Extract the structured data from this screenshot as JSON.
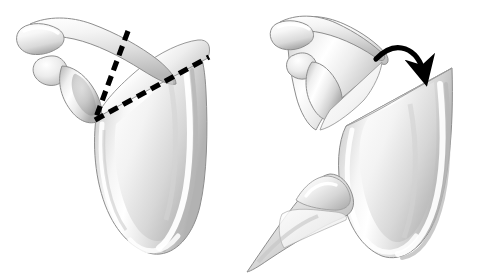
{
  "figure": {
    "title": "Scapular osteotomy: wedge resection of the scapular body",
    "background_color": "#ffffff",
    "width": 482,
    "height": 279,
    "illustration_style": "grayscale airbrush medical illustration",
    "panel_count": 2
  },
  "palette": {
    "background": "#ffffff",
    "bone_light": "#fdfdfd",
    "bone_mid": "#e3e3e3",
    "bone_shadow": "#b9b9b9",
    "bone_deep_shadow": "#9a9a9a",
    "outline": "#8d8d8d",
    "cut_face": "#efefef",
    "marking_black": "#000000"
  },
  "panels": [
    {
      "id": "panel-left",
      "name": "preoperative-planning-panel",
      "caption": "",
      "description": "Posterior view of the scapula with dashed osteotomy lines marking the planned wedge",
      "structures": [
        {
          "name": "acromion",
          "label": "Acromion"
        },
        {
          "name": "coracoid-process",
          "label": "Coracoid process"
        },
        {
          "name": "spine-of-scapula",
          "label": "Spine of scapula"
        },
        {
          "name": "glenoid",
          "label": "Glenoid"
        },
        {
          "name": "scapular-body",
          "label": "Scapular body"
        },
        {
          "name": "infraspinous-fossa",
          "label": "Infraspinous fossa"
        },
        {
          "name": "lateral-border",
          "label": "Lateral border"
        },
        {
          "name": "inferior-angle",
          "label": "Inferior angle"
        }
      ],
      "markings": [
        {
          "name": "osteotomy-line-medial",
          "style": "dashed",
          "color": "#000000",
          "thickness": 5,
          "dash": [
            10,
            6
          ],
          "from": [
            128,
            31
          ],
          "to": [
            95,
            120
          ]
        },
        {
          "name": "osteotomy-line-lateral",
          "style": "dashed",
          "color": "#000000",
          "thickness": 5,
          "dash": [
            10,
            6
          ],
          "from": [
            95,
            120
          ],
          "to": [
            209,
            57
          ]
        }
      ]
    },
    {
      "id": "panel-right",
      "name": "postoperative-result-panel",
      "caption": "",
      "description": "Scapula after the wedge has been removed; the body is rotated and the excised wedge fragment lies separately",
      "structures": [
        {
          "name": "acromion",
          "label": "Acromion"
        },
        {
          "name": "coracoid-process",
          "label": "Coracoid process"
        },
        {
          "name": "glenoid",
          "label": "Glenoid"
        },
        {
          "name": "rotated-scapular-body",
          "label": "Rotated scapular body"
        },
        {
          "name": "osteotomy-cut-surface",
          "label": "Osteotomy cut surface"
        },
        {
          "name": "excised-wedge-fragment",
          "label": "Excised wedge fragment"
        }
      ],
      "markings": [
        {
          "name": "rotation-arrow",
          "style": "curved-arrow",
          "color": "#000000",
          "thickness": 5,
          "from": [
            376,
            59
          ],
          "control": [
            404,
            42
          ],
          "to": [
            425,
            80
          ],
          "arrowhead": "solid-triangle"
        }
      ]
    }
  ]
}
